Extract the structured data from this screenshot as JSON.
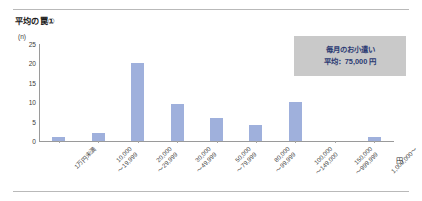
{
  "chart_title": "平均の罠①",
  "axis_unit_y": "(n)",
  "axis_unit_x": "円",
  "callout": {
    "line1": "毎月のお小遣い",
    "line2": "平均：75,000 円"
  },
  "colors": {
    "bar": "#9fb0dc",
    "callout_bg": "#c9c9c9",
    "callout_text": "#2b3a73",
    "axis": "#9a9a9a",
    "rule": "#b9b9b9"
  },
  "chart_data": {
    "type": "bar",
    "title": "平均の罠①",
    "xlabel": "円",
    "ylabel": "(n)",
    "ylim": [
      0,
      25
    ],
    "yticks": [
      0,
      5,
      10,
      15,
      20,
      25
    ],
    "grid": false,
    "legend": "none",
    "categories": [
      "1万円未満",
      "10,000\n～19,999",
      "20,000\n～29,999",
      "30,000\n～49,999",
      "50,000\n～79,999",
      "80,000\n～99,999",
      "100,000\n～149,000",
      "150,000\n～999,999",
      "1,000,000～"
    ],
    "values": [
      1,
      2,
      20,
      9.5,
      6,
      4,
      10,
      0,
      1
    ],
    "annotations": [
      "毎月のお小遣い",
      "平均：75,000 円"
    ]
  }
}
